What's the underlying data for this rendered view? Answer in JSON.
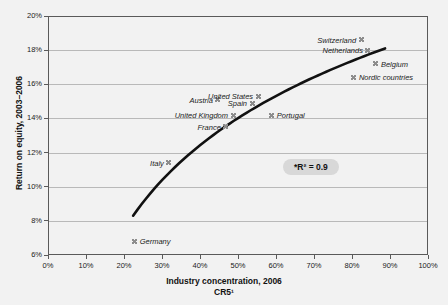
{
  "chart_data": {
    "type": "scatter",
    "title": "",
    "xlabel": "Industry concentration, 2006",
    "xlabel_line2": "CR5¹",
    "ylabel": "Return on equity, 2003–2006",
    "xlim": [
      0,
      100
    ],
    "ylim": [
      6,
      20
    ],
    "xticks": [
      "0%",
      "10%",
      "20%",
      "30%",
      "40%",
      "50%",
      "60%",
      "70%",
      "80%",
      "90%",
      "100%"
    ],
    "xtick_values": [
      0,
      10,
      20,
      30,
      40,
      50,
      60,
      70,
      80,
      90,
      100
    ],
    "yticks": [
      "6%",
      "8%",
      "10%",
      "12%",
      "14%",
      "16%",
      "18%",
      "20%"
    ],
    "ytick_values": [
      6,
      8,
      10,
      12,
      14,
      16,
      18,
      20
    ],
    "grid": "horizontal",
    "legend": "none",
    "annotation": "*R² = 0.9",
    "points": [
      {
        "name": "Germany",
        "x": 22.8,
        "y": 6.8,
        "label_side": "right"
      },
      {
        "name": "Italy",
        "x": 31.8,
        "y": 11.4,
        "label_side": "left"
      },
      {
        "name": "Austria",
        "x": 44.7,
        "y": 15.1,
        "label_side": "left"
      },
      {
        "name": "United Kingdom",
        "x": 48.7,
        "y": 14.2,
        "label_side": "left"
      },
      {
        "name": "France",
        "x": 46.8,
        "y": 13.5,
        "label_side": "left"
      },
      {
        "name": "Spain",
        "x": 53.7,
        "y": 14.9,
        "label_side": "left"
      },
      {
        "name": "United States",
        "x": 55.3,
        "y": 15.3,
        "label_side": "left"
      },
      {
        "name": "Portugal",
        "x": 58.9,
        "y": 14.2,
        "label_side": "right"
      },
      {
        "name": "Switzerland",
        "x": 82.4,
        "y": 18.6,
        "label_side": "left"
      },
      {
        "name": "Netherlands",
        "x": 84.2,
        "y": 18.0,
        "label_side": "left"
      },
      {
        "name": "Belgium",
        "x": 86.3,
        "y": 17.2,
        "label_side": "right"
      },
      {
        "name": "Nordic countries",
        "x": 80.5,
        "y": 16.4,
        "label_side": "right"
      }
    ],
    "trendline": {
      "type": "log",
      "x_start": 22.4,
      "x_end": 88.7,
      "y_start": 8.3,
      "y_end": 18.1,
      "color": "#111111",
      "width": 2.6
    },
    "colors": {
      "background": "#f2f2f2",
      "frame": "#5a5a5a",
      "gridline": "#b9b9b9",
      "marker": "#8d8d8d",
      "text": "#1b1b1b",
      "pill": "#d8d8d8"
    }
  }
}
